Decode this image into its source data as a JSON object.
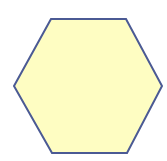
{
  "canvas": {
    "width": 167,
    "height": 161,
    "background": "#ffffff"
  },
  "shape": {
    "type": "hexagon",
    "points": "51,19 126,19 162,86 127,153 52,153 14,86",
    "fill": "#fefdc2",
    "stroke": "#4b5a94",
    "stroke_width": 2
  }
}
